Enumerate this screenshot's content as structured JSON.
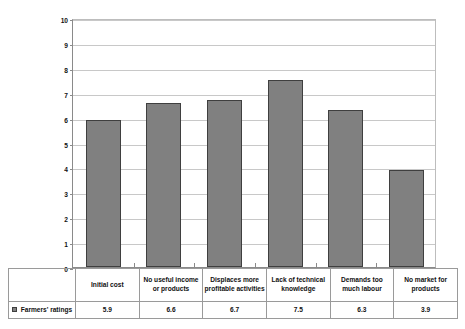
{
  "chart_data": {
    "type": "bar",
    "title": "",
    "subtitle": "",
    "xlabel": "",
    "ylabel": "Mean score out of 10",
    "ylim": [
      0,
      10
    ],
    "ytick_labels": [
      "10",
      "9",
      "8",
      "7",
      "6",
      "5",
      "4",
      "3",
      "2",
      "1",
      "0"
    ],
    "ytick_values": [
      10,
      9,
      8,
      7,
      6,
      5,
      4,
      3,
      2,
      1,
      0
    ],
    "grid": true,
    "legend_position": "bottom-left-table-stub",
    "categories": [
      "Initial cost",
      "No useful income or products",
      "Displaces more profitable activities",
      "Lack of technical knowledge",
      "Demands too much labour",
      "No market for products"
    ],
    "series": [
      {
        "name": "Farmers' ratings",
        "values": [
          5.9,
          6.6,
          6.7,
          7.5,
          6.3,
          3.9
        ],
        "value_labels": [
          "5.9",
          "6.6",
          "6.7",
          "7.5",
          "6.3",
          "3.9"
        ],
        "color": "#808080",
        "border_color": "#3f3f3f"
      }
    ]
  },
  "axis": {
    "y_title": "Mean score out of 10"
  },
  "table": {
    "legend_label": "Farmers' ratings",
    "category_headers": [
      "Initial cost",
      "No useful income or products",
      "Displaces more profitable activities",
      "Lack of technical knowledge",
      "Demands too much labour",
      "No market for products"
    ],
    "value_row": [
      "5.9",
      "6.6",
      "6.7",
      "7.5",
      "6.3",
      "3.9"
    ]
  },
  "colors": {
    "bar_fill": "#808080",
    "bar_border": "#3f3f3f",
    "gridline": "#c8c8c8",
    "axis": "#8a8a8a",
    "table_border": "#9a9a9a"
  }
}
